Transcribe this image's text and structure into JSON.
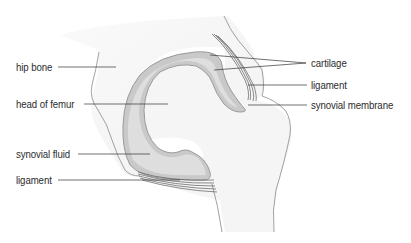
{
  "diagram": {
    "colors": {
      "bone_fill": "#f4f4f4",
      "bone_outline": "#8a8a8a",
      "cartilage_fill": "#c9c9c9",
      "cartilage_edge": "#9a9a9a",
      "synovial_fluid_fill": "#dedede",
      "ligament": "#5a5a5a",
      "leader_line": "#333333",
      "label_text": "#2b2b2b"
    },
    "labels": {
      "left": [
        {
          "id": "hip-bone",
          "text": "hip bone"
        },
        {
          "id": "head-of-femur",
          "text": "head of femur"
        },
        {
          "id": "synovial-fluid",
          "text": "synovial fluid"
        },
        {
          "id": "ligament-bottom",
          "text": "ligament"
        }
      ],
      "right": [
        {
          "id": "cartilage",
          "text": "cartilage"
        },
        {
          "id": "ligament-top",
          "text": "ligament"
        },
        {
          "id": "synovial-membrane",
          "text": "synovial membrane"
        }
      ]
    }
  }
}
